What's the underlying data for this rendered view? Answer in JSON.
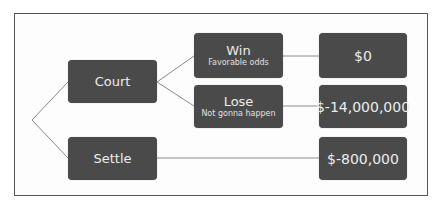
{
  "diagram": {
    "type": "decision-tree",
    "colors": {
      "node_fill": "#4a4a4a",
      "node_text": "#ececec",
      "line": "#8a8a8a",
      "frame": "#555555"
    },
    "nodes": {
      "court": {
        "title": "Court"
      },
      "settle": {
        "title": "Settle"
      },
      "win": {
        "title": "Win",
        "subtitle": "Favorable odds"
      },
      "lose": {
        "title": "Lose",
        "subtitle": "Not gonna happen"
      },
      "win_result": {
        "title": "$0"
      },
      "lose_result": {
        "title": "$-14,000,000"
      },
      "settle_result": {
        "title": "$-800,000"
      }
    },
    "edges": [
      [
        "root",
        "court"
      ],
      [
        "root",
        "settle"
      ],
      [
        "court",
        "win"
      ],
      [
        "court",
        "lose"
      ],
      [
        "win",
        "win_result"
      ],
      [
        "lose",
        "lose_result"
      ],
      [
        "settle",
        "settle_result"
      ]
    ]
  }
}
